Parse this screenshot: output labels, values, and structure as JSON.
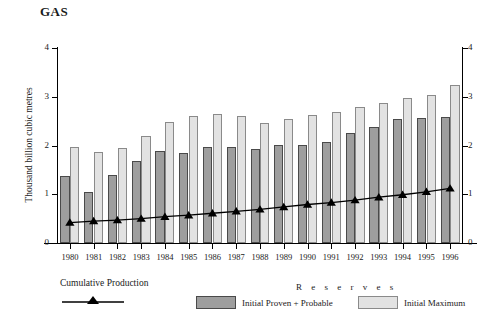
{
  "chart_data": {
    "type": "bar",
    "title": "GAS",
    "xlabel": "",
    "ylabel": "Thousand billion cubic metres",
    "ylim": [
      0,
      4
    ],
    "yticks": [
      0,
      1,
      2,
      3,
      4
    ],
    "ytick_labels": [
      "0",
      "1",
      "2",
      "3",
      "4"
    ],
    "right_axis": true,
    "right_ytick_labels": [
      "0",
      "1",
      "2",
      "3",
      "4"
    ],
    "grid": false,
    "legend_position": "bottom",
    "legend_group_label": "R e s e r v e s",
    "categories": [
      "1980",
      "1981",
      "1982",
      "1983",
      "1984",
      "1985",
      "1986",
      "1987",
      "1988",
      "1989",
      "1990",
      "1991",
      "1992",
      "1993",
      "1994",
      "1995",
      "1996"
    ],
    "series": [
      {
        "name": "Initial Proven + Probable",
        "type": "bar",
        "color": "#9e9e9e",
        "values": [
          1.38,
          1.05,
          1.4,
          1.68,
          1.88,
          1.85,
          1.97,
          1.97,
          1.92,
          2.02,
          2.02,
          2.08,
          2.26,
          2.37,
          2.54,
          2.56,
          2.58
        ]
      },
      {
        "name": "Initial Maximum",
        "type": "bar",
        "color": "#e2e2e2",
        "values": [
          1.96,
          1.86,
          1.95,
          2.2,
          2.48,
          2.6,
          2.65,
          2.6,
          2.47,
          2.55,
          2.63,
          2.68,
          2.8,
          2.88,
          2.97,
          3.03,
          3.25
        ]
      },
      {
        "name": "Cumulative Production",
        "type": "line",
        "color": "#000000",
        "marker": "triangle",
        "values": [
          0.42,
          0.45,
          0.47,
          0.5,
          0.54,
          0.57,
          0.61,
          0.65,
          0.69,
          0.74,
          0.79,
          0.83,
          0.88,
          0.94,
          0.99,
          1.05,
          1.12
        ]
      }
    ]
  },
  "legend": {
    "cumulative_label": "Cumulative Production",
    "proven_label": "Initial Proven + Probable",
    "maximum_label": "Initial Maximum"
  }
}
